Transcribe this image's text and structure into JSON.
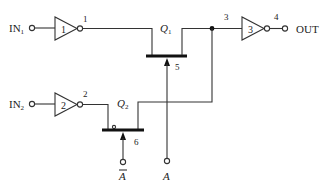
{
  "diagram": {
    "type": "circuit-schematic",
    "inputs": [
      {
        "id": "in1",
        "label": "IN",
        "subscript": "1"
      },
      {
        "id": "in2",
        "label": "IN",
        "subscript": "2"
      }
    ],
    "output": {
      "label": "OUT"
    },
    "inverters": [
      {
        "id": "inv1",
        "label": "1",
        "node_label": "1"
      },
      {
        "id": "inv2",
        "label": "2",
        "node_label": "2"
      },
      {
        "id": "inv3",
        "label": "3",
        "node_label": "4"
      }
    ],
    "transistors": [
      {
        "id": "q1",
        "label": "Q",
        "subscript": "1",
        "gate_node": "5",
        "gate_input": "A"
      },
      {
        "id": "q2",
        "label": "Q",
        "subscript": "2",
        "gate_node": "6",
        "gate_input": "Ā"
      }
    ],
    "nodes": {
      "junction": "3"
    },
    "control_inputs": {
      "a": "A",
      "a_bar": "A"
    },
    "colors": {
      "line": "#333333",
      "background": "#ffffff"
    }
  }
}
